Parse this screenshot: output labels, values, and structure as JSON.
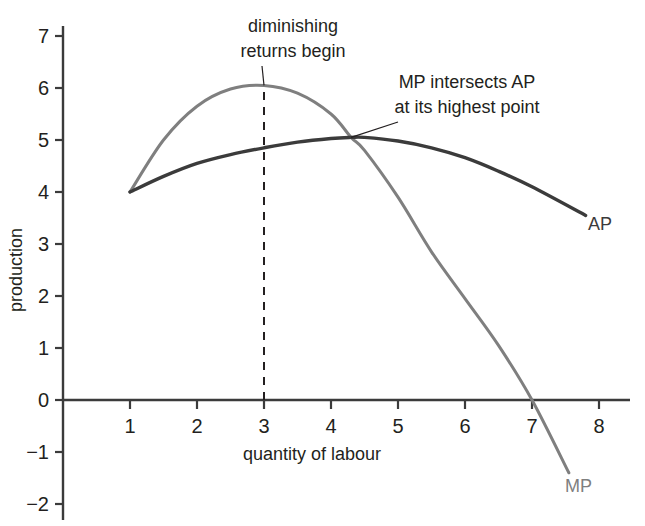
{
  "chart_data": {
    "type": "line",
    "title": "",
    "xlabel": "quantity of labour",
    "ylabel": "production",
    "xlim": [
      0,
      8.6
    ],
    "ylim": [
      -2.3,
      7.4
    ],
    "grid": false,
    "legend_position": "at-line-ends",
    "x_ticks": [
      "1",
      "2",
      "3",
      "4",
      "5",
      "6",
      "7",
      "8"
    ],
    "x_tick_values": [
      1,
      2,
      3,
      4,
      5,
      6,
      7,
      8
    ],
    "y_ticks": [
      "7",
      "6",
      "5",
      "4",
      "3",
      "2",
      "1",
      "0",
      "−1",
      "−2"
    ],
    "y_tick_values": [
      7,
      6,
      5,
      4,
      3,
      2,
      1,
      0,
      -1,
      -2
    ],
    "series": [
      {
        "name": "MP",
        "label": "MP",
        "color": "#7f7f7f",
        "x": [
          1.0,
          1.5,
          2.0,
          2.5,
          3.0,
          3.5,
          4.0,
          4.3,
          4.5,
          5.0,
          5.5,
          6.0,
          6.5,
          7.0,
          7.55
        ],
        "values": [
          4.0,
          5.0,
          5.65,
          5.98,
          6.05,
          5.9,
          5.5,
          5.05,
          4.8,
          3.9,
          2.85,
          1.95,
          1.05,
          0.0,
          -1.4
        ]
      },
      {
        "name": "AP",
        "label": "AP",
        "color": "#3b3b3b",
        "x": [
          1.0,
          1.5,
          2.0,
          2.5,
          3.0,
          3.5,
          4.0,
          4.3,
          4.5,
          5.0,
          5.5,
          6.0,
          6.5,
          7.0,
          7.8
        ],
        "values": [
          4.0,
          4.3,
          4.55,
          4.72,
          4.85,
          4.96,
          5.03,
          5.05,
          5.05,
          4.98,
          4.85,
          4.66,
          4.4,
          4.1,
          3.55
        ]
      }
    ],
    "markers": [
      {
        "name": "diminishing-returns-line",
        "type": "vline",
        "x": 3,
        "y_from": 0,
        "y_to": 6.05,
        "style": "dashed"
      }
    ],
    "annotations": [
      {
        "name": "diminishing-returns",
        "line1": "diminishing",
        "line2": "returns begin",
        "target_x": 3.0,
        "target_y": 6.05
      },
      {
        "name": "mp-intersects-ap",
        "line1": "MP intersects AP",
        "line2": "at its highest point",
        "target_x": 4.3,
        "target_y": 5.05
      }
    ]
  }
}
